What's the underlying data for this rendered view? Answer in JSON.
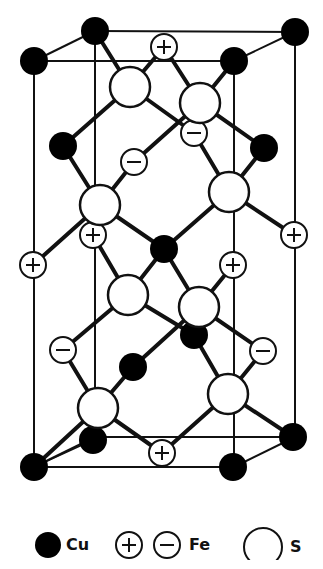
{
  "legend": {
    "cu_label": "Cu",
    "fe_label": "Fe",
    "s_label": "S",
    "fe_plus_symbol": "+",
    "fe_minus_symbol": "−"
  },
  "atoms": [
    {
      "type": "Cu",
      "id": "cu-1"
    },
    {
      "type": "Cu",
      "id": "cu-2"
    },
    {
      "type": "Cu",
      "id": "cu-3"
    },
    {
      "type": "Cu",
      "id": "cu-4"
    },
    {
      "type": "Cu",
      "id": "cu-5"
    },
    {
      "type": "Cu",
      "id": "cu-6"
    },
    {
      "type": "Cu",
      "id": "cu-7"
    },
    {
      "type": "Cu",
      "id": "cu-8"
    },
    {
      "type": "Cu",
      "id": "cu-9"
    },
    {
      "type": "Cu",
      "id": "cu-10"
    },
    {
      "type": "Cu",
      "id": "cu-11"
    },
    {
      "type": "Cu",
      "id": "cu-12"
    },
    {
      "type": "Cu",
      "id": "cu-13"
    },
    {
      "type": "Fe+",
      "id": "fe-plus-1"
    },
    {
      "type": "Fe+",
      "id": "fe-plus-2"
    },
    {
      "type": "Fe+",
      "id": "fe-plus-3"
    },
    {
      "type": "Fe+",
      "id": "fe-plus-4"
    },
    {
      "type": "Fe+",
      "id": "fe-plus-5"
    },
    {
      "type": "Fe+",
      "id": "fe-plus-6"
    },
    {
      "type": "Fe-",
      "id": "fe-minus-1"
    },
    {
      "type": "Fe-",
      "id": "fe-minus-2"
    },
    {
      "type": "Fe-",
      "id": "fe-minus-3"
    },
    {
      "type": "Fe-",
      "id": "fe-minus-4"
    },
    {
      "type": "S",
      "id": "s-1"
    },
    {
      "type": "S",
      "id": "s-2"
    },
    {
      "type": "S",
      "id": "s-3"
    },
    {
      "type": "S",
      "id": "s-4"
    },
    {
      "type": "S",
      "id": "s-5"
    },
    {
      "type": "S",
      "id": "s-6"
    },
    {
      "type": "S",
      "id": "s-7"
    },
    {
      "type": "S",
      "id": "s-8"
    }
  ]
}
